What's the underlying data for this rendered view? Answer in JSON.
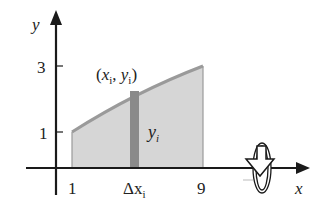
{
  "diagram": {
    "axes": {
      "x_label": "x",
      "y_label": "y",
      "x_ticks": [
        {
          "value": 1,
          "label": "1"
        },
        {
          "value": 9,
          "label": "9"
        }
      ],
      "y_ticks": [
        {
          "value": 1,
          "label": "1"
        },
        {
          "value": 3,
          "label": "3"
        }
      ],
      "strip_tick_label": "Δx",
      "strip_tick_sub": "i"
    },
    "region": {
      "description": "Shaded region under curve from x=1 to x=9",
      "fill_color": "#d6d6d6",
      "curve_color": "#9a9a9a",
      "x_start": 1,
      "x_end": 9,
      "y_at_start": 1,
      "y_at_end": 3
    },
    "strip": {
      "fill_color": "#8a8a8a",
      "point_label_open": "(",
      "point_x": "x",
      "point_x_sub": "i",
      "point_sep": ", ",
      "point_y": "y",
      "point_y_sub": "i",
      "point_label_close": ")",
      "height_label": "y",
      "height_label_sub": "i"
    },
    "rotation_icon": "revolve-about-x-axis"
  }
}
